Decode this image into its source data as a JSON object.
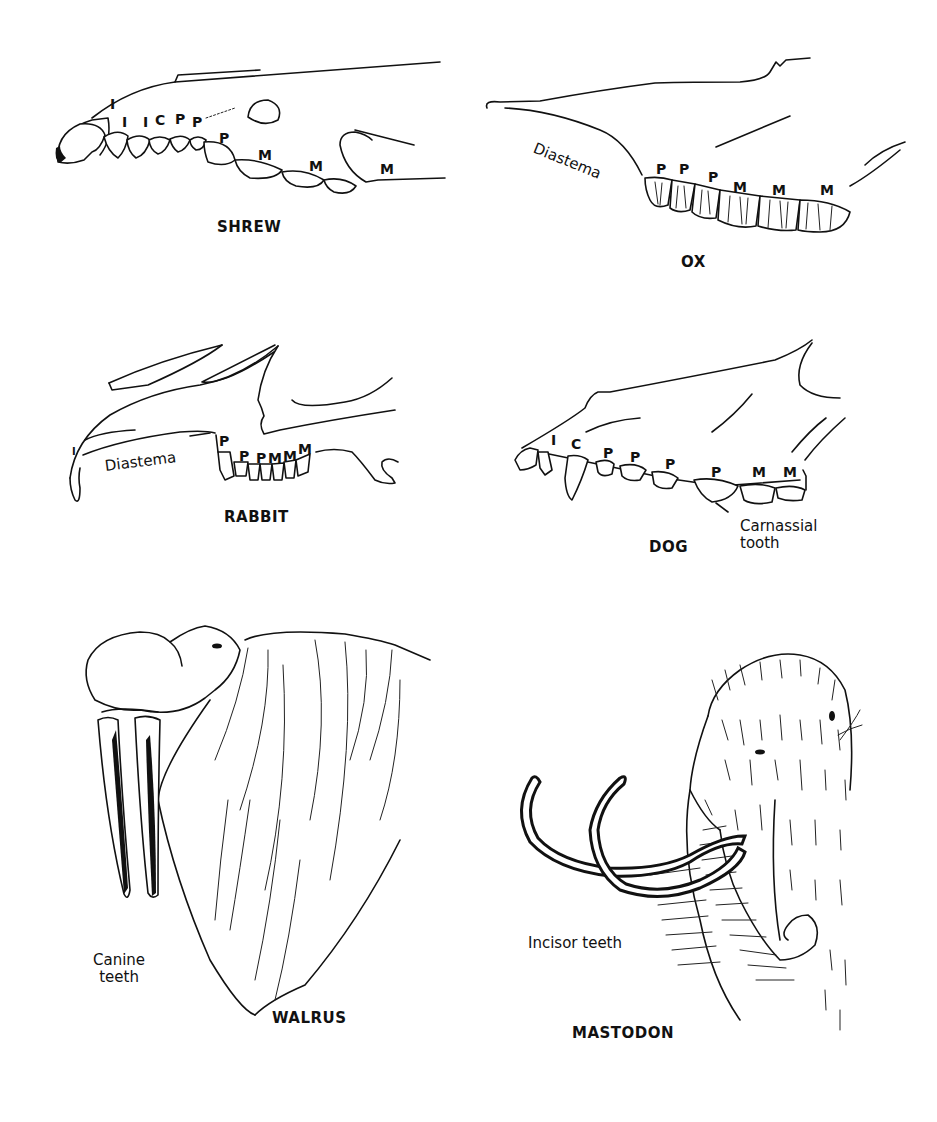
{
  "figure": {
    "panels": [
      {
        "id": "shrew",
        "name": "SHREW",
        "tooth_labels": [
          "I",
          "I",
          "I",
          "C",
          "P",
          "P",
          "P",
          "M",
          "M",
          "M"
        ]
      },
      {
        "id": "ox",
        "name": "OX",
        "annotation": "Diastema",
        "tooth_labels": [
          "P",
          "P",
          "P",
          "M",
          "M",
          "M"
        ]
      },
      {
        "id": "rabbit",
        "name": "RABBIT",
        "annotation": "Diastema",
        "tooth_labels": [
          "I",
          "P",
          "P",
          "P",
          "M",
          "M",
          "M"
        ]
      },
      {
        "id": "dog",
        "name": "DOG",
        "annotation_line1": "Carnassial",
        "annotation_line2": "tooth",
        "tooth_labels": [
          "I",
          "C",
          "P",
          "P",
          "P",
          "P",
          "M",
          "M"
        ]
      },
      {
        "id": "walrus",
        "name": "WALRUS",
        "annotation_line1": "Canine",
        "annotation_line2": "teeth"
      },
      {
        "id": "mastodon",
        "name": "MASTODON",
        "annotation": "Incisor teeth"
      }
    ]
  }
}
